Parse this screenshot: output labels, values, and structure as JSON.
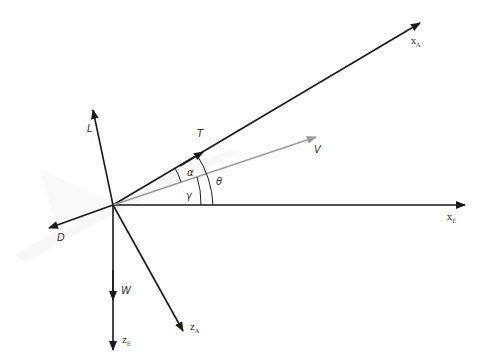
{
  "diagram": {
    "forces": {
      "lift": "L",
      "thrust": "T",
      "drag": "D",
      "weight": "W",
      "velocity": "V"
    },
    "angles": {
      "alpha": "α",
      "gamma": "γ",
      "theta": "θ"
    },
    "axes": {
      "xA": {
        "main": "x",
        "sub": "A"
      },
      "xE": {
        "main": "x",
        "sub": "E"
      },
      "zA": {
        "main": "z",
        "sub": "A"
      },
      "zE": {
        "main": "z",
        "sub": "E"
      }
    },
    "colors": {
      "line": "#1a1a1a",
      "velocity": "#9a9a9a",
      "aircraft": "#ececec"
    }
  }
}
